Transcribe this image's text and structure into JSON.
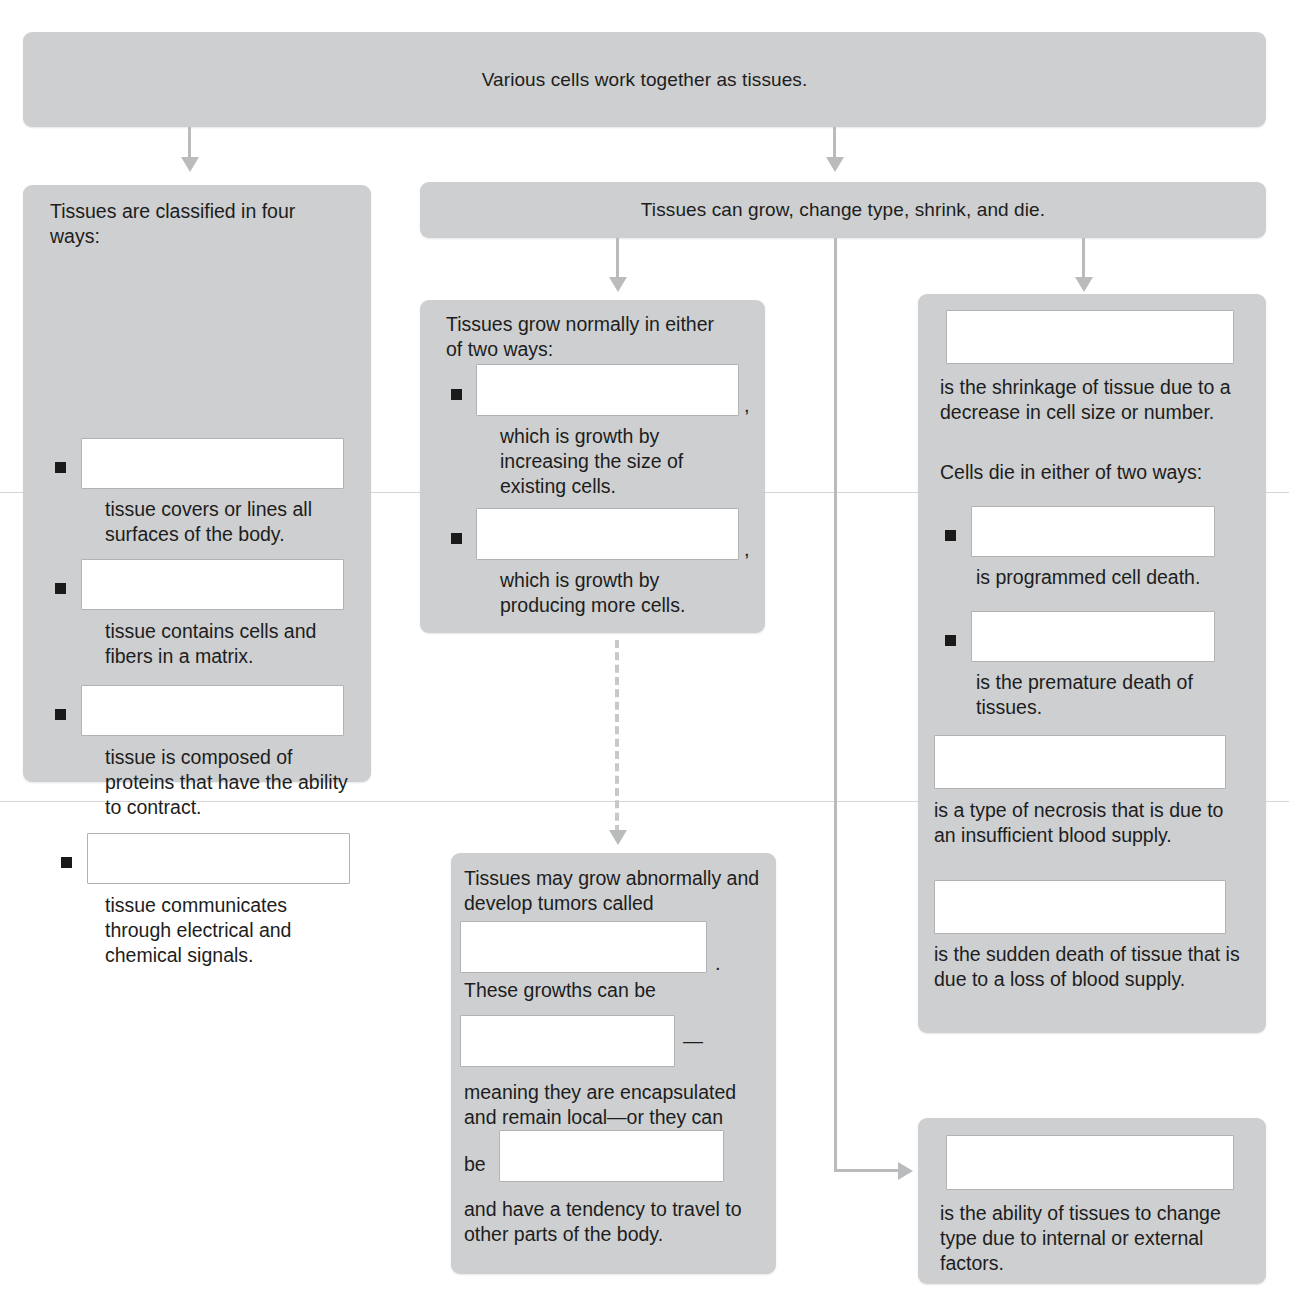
{
  "diagram": {
    "title": "Various cells work together as tissues.",
    "top_banner": {
      "text": "Various cells work together as tissues."
    },
    "branch_banner": {
      "text": "Tissues can grow, change type, shrink, and die."
    },
    "left_panel": {
      "heading": "Tissues are classified in four ways:",
      "items": [
        {
          "blank_value": "",
          "description": "tissue covers or lines all surfaces of the body."
        },
        {
          "blank_value": "",
          "description": "tissue contains cells and fibers in a matrix."
        },
        {
          "blank_value": "",
          "description": "tissue is composed of proteins that have the ability to contract."
        },
        {
          "blank_value": "",
          "description": "tissue communicates through electrical and chemical signals."
        }
      ]
    },
    "growth_panel": {
      "heading": "Tissues grow normally in either of two ways:",
      "items": [
        {
          "blank_value": "",
          "trailing_punct": ",",
          "description": "which is growth by increasing the size of existing cells."
        },
        {
          "blank_value": "",
          "trailing_punct": ",",
          "description": "which is growth by producing more cells."
        }
      ]
    },
    "tumor_panel": {
      "line1": "Tissues may grow abnormally and develop tumors called",
      "blank1_value": "",
      "punct1": ".",
      "line2": "These growths can be",
      "blank2_value": "",
      "punct2": "—",
      "line3": "meaning they are encapsulated and remain local—or they can",
      "line4_prefix": "be",
      "blank3_value": "",
      "line5": "and have a tendency to travel to other parts of the body."
    },
    "atrophy_panel": {
      "blank1_value": "",
      "line1": "is the shrinkage of tissue due to a decrease in cell size or number.",
      "heading2": "Cells die in either of two ways:",
      "items": [
        {
          "blank_value": "",
          "description": "is programmed cell death."
        },
        {
          "blank_value": "",
          "description": "is the premature death of tissues."
        }
      ],
      "blank2_value": "",
      "line2": "is a type of necrosis that is due to an insufficient blood supply.",
      "blank3_value": "",
      "line3": "is the sudden death of tissue that is due to a loss of blood supply."
    },
    "metaplasia_panel": {
      "blank_value": "",
      "line1": "is the ability of tissues to change type due to internal or external factors."
    },
    "colors": {
      "panel_fill": "#cdcfd0",
      "blank_fill": "#ffffff",
      "blank_border": "#b0b2b3",
      "connector": "#b9bbbc",
      "text": "#1d1d1d",
      "bullet": "#1a1a1a",
      "page_background": "#ffffff"
    }
  }
}
